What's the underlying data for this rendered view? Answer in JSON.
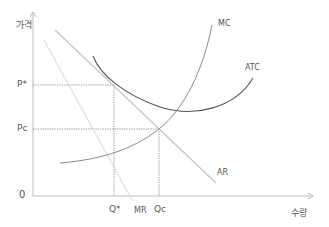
{
  "diagram": {
    "type": "monopoly-price-output",
    "axes": {
      "y_label": "가격",
      "x_label": "수량",
      "origin_label": "0"
    },
    "price_labels": {
      "p_star": "P*",
      "p_c": "Pc"
    },
    "quantity_labels": {
      "q_star": "Q*",
      "q_c": "Qc"
    },
    "curves": {
      "mc": "MC",
      "atc": "ATC",
      "ar": "AR",
      "mr": "MR"
    },
    "colors": {
      "axis": "#bdbdbd",
      "mc": "#8a8a8a",
      "atc": "#555555",
      "ar": "#c4c4c4",
      "mr": "#dedede",
      "guide": "#777777",
      "text": "#555555"
    }
  }
}
